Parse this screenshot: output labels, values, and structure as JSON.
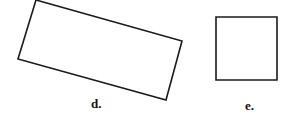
{
  "figure": {
    "background": "#ffffff",
    "stroke_color": "#1a1a1a",
    "shapes": [
      {
        "id": "d",
        "kind": "rotated-rectangle",
        "label": "d.",
        "points": "36,0 182,41 166,100 18,59"
      },
      {
        "id": "e",
        "kind": "square",
        "label": "e.",
        "points": "216,17 277,17 277,80 216,80"
      }
    ]
  }
}
